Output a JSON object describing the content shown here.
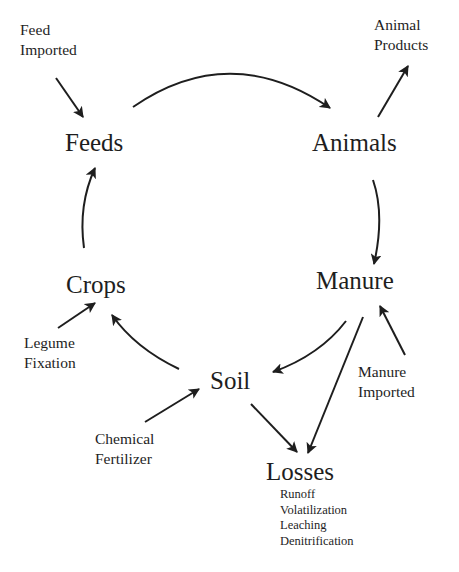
{
  "diagram": {
    "type": "nutrient-cycle",
    "colors": {
      "ink": "#1e1e1e",
      "background": "#ffffff"
    },
    "nodes": {
      "feeds": "Feeds",
      "animals": "Animals",
      "manure": "Manure",
      "soil": "Soil",
      "crops": "Crops",
      "losses": "Losses"
    },
    "inputs": {
      "feed_imported": [
        "Feed",
        "Imported"
      ],
      "animal_products": [
        "Animal",
        "Products"
      ],
      "manure_imported": [
        "Manure",
        "Imported"
      ],
      "chemical_fertilizer": [
        "Chemical",
        "Fertilizer"
      ],
      "legume_fixation": [
        "Legume",
        "Fixation"
      ]
    },
    "losses_list": [
      "Runoff",
      "Volatilization",
      "Leaching",
      "Denitrification"
    ],
    "edges": [
      {
        "from": "Feeds",
        "to": "Animals"
      },
      {
        "from": "Animals",
        "to": "Animal Products"
      },
      {
        "from": "Animals",
        "to": "Manure"
      },
      {
        "from": "Manure",
        "to": "Soil"
      },
      {
        "from": "Manure",
        "to": "Losses"
      },
      {
        "from": "Manure Imported",
        "to": "Manure"
      },
      {
        "from": "Soil",
        "to": "Losses"
      },
      {
        "from": "Soil",
        "to": "Crops"
      },
      {
        "from": "Chemical Fertilizer",
        "to": "Soil"
      },
      {
        "from": "Legume Fixation",
        "to": "Crops"
      },
      {
        "from": "Crops",
        "to": "Feeds"
      },
      {
        "from": "Feed Imported",
        "to": "Feeds"
      }
    ]
  }
}
